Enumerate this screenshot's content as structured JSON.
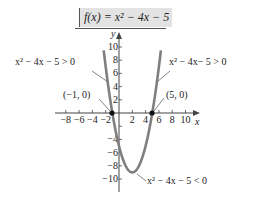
{
  "title": "f(x) = x² − 4x − 5",
  "chart_data": {
    "type": "line",
    "xlabel": "x",
    "ylabel": "y",
    "xlim": [
      -9,
      11.5
    ],
    "ylim": [
      -11.5,
      11.5
    ],
    "x_ticks": [
      -8,
      -6,
      -4,
      -2,
      2,
      4,
      6,
      8,
      10
    ],
    "y_ticks": [
      -10,
      -8,
      -6,
      -4,
      -2,
      2,
      4,
      6,
      8,
      10
    ],
    "x_tick_labels": [
      "−8",
      "−6",
      "−4",
      "−2",
      "2",
      "4",
      "6",
      "8",
      "10"
    ],
    "y_tick_labels": [
      "−10",
      "−8",
      "−6",
      "−4",
      "2",
      "4",
      "6",
      "8",
      "10"
    ],
    "grid": false,
    "series": [
      {
        "name": "f(x) = x^2 - 4x - 5",
        "function": "x^2 - 4x - 5",
        "x_range": [
          -2.3,
          6.3
        ],
        "color": "#7f7f7f"
      }
    ],
    "points": [
      {
        "label": "(−1, 0)",
        "x": -1,
        "y": 0
      },
      {
        "label": "(5, 0)",
        "x": 5,
        "y": 0
      }
    ],
    "vertex": {
      "x": 2,
      "y": -9
    },
    "annotations": [
      {
        "text": "x² − 4x − 5 > 0",
        "region": "left branch above x-axis"
      },
      {
        "text": "x² − 4x− 5 > 0",
        "region": "right branch above x-axis"
      },
      {
        "text": "x² − 4x − 5 < 0",
        "region": "below x-axis between roots"
      }
    ]
  },
  "labels": {
    "left_pos": "x² − 4x − 5 > 0",
    "right_pos": "x² − 4x− 5 > 0",
    "neg": "x² − 4x − 5 < 0",
    "pt_left": "(−1, 0)",
    "pt_right": "(5, 0)",
    "x_axis": "x",
    "y_axis": "y"
  },
  "colors": {
    "curve": "#7f7f7f",
    "title_bg": "#e3e3e3",
    "axis": "#444444"
  }
}
